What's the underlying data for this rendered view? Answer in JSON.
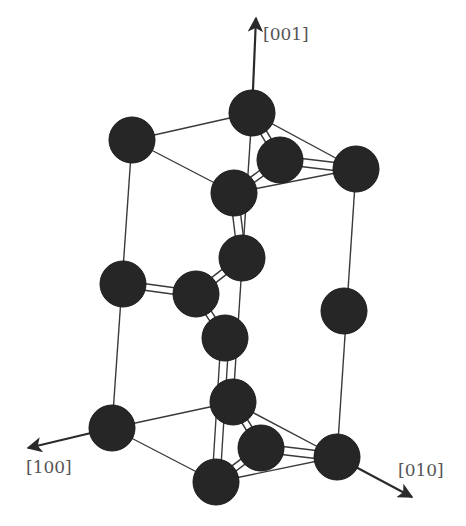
{
  "figure": {
    "title": "",
    "colors": {
      "atom": "#262626",
      "line": "#3a3a3a",
      "label": "#555555",
      "background": "#ffffff"
    },
    "atom_radius": 23
  },
  "axes": [
    {
      "id": "z",
      "label": "[001]",
      "from": [
        252,
        113
      ],
      "to": [
        256,
        18
      ],
      "label_pos": [
        263,
        40
      ]
    },
    {
      "id": "x",
      "label": "[100]",
      "from": [
        112,
        428
      ],
      "to": [
        28,
        448
      ],
      "label_pos": [
        26,
        473
      ]
    },
    {
      "id": "y",
      "label": "[010]",
      "from": [
        337,
        457
      ],
      "to": [
        412,
        497
      ],
      "label_pos": [
        398,
        476
      ]
    }
  ],
  "atoms": [
    {
      "id": "A1",
      "layer": "top",
      "x": 132,
      "y": 140
    },
    {
      "id": "A2",
      "layer": "top",
      "x": 252,
      "y": 113
    },
    {
      "id": "A3",
      "layer": "top",
      "x": 280,
      "y": 160
    },
    {
      "id": "A4",
      "layer": "top",
      "x": 356,
      "y": 169
    },
    {
      "id": "A5",
      "layer": "top",
      "x": 234,
      "y": 193
    },
    {
      "id": "B1",
      "layer": "middle",
      "x": 123,
      "y": 284
    },
    {
      "id": "B2",
      "layer": "middle",
      "x": 196,
      "y": 294
    },
    {
      "id": "B3",
      "layer": "middle",
      "x": 242,
      "y": 258
    },
    {
      "id": "B4",
      "layer": "middle",
      "x": 225,
      "y": 338
    },
    {
      "id": "B5",
      "layer": "middle",
      "x": 344,
      "y": 311
    },
    {
      "id": "C1",
      "layer": "bottom",
      "x": 112,
      "y": 428
    },
    {
      "id": "C2",
      "layer": "bottom",
      "x": 233,
      "y": 402
    },
    {
      "id": "C3",
      "layer": "bottom",
      "x": 261,
      "y": 448
    },
    {
      "id": "C4",
      "layer": "bottom",
      "x": 337,
      "y": 457
    },
    {
      "id": "C5",
      "layer": "bottom",
      "x": 216,
      "y": 482
    }
  ],
  "cell_edges": [
    [
      "A1",
      "A2"
    ],
    [
      "A1",
      "A5"
    ],
    [
      "A2",
      "A4"
    ],
    [
      "A5",
      "A4"
    ],
    [
      "C1",
      "C2"
    ],
    [
      "C1",
      "C5"
    ],
    [
      "C2",
      "C4"
    ],
    [
      "C5",
      "C4"
    ],
    [
      "A1",
      "C1"
    ],
    [
      "A4",
      "C4"
    ],
    [
      "A2",
      "C2"
    ]
  ],
  "double_lines": [
    [
      "A3",
      "A4"
    ],
    [
      "C3",
      "C4"
    ],
    [
      "A5",
      "B3"
    ],
    [
      "B4",
      "C5"
    ]
  ],
  "bonds": [
    [
      "A2",
      "A3"
    ],
    [
      "A3",
      "A5"
    ],
    [
      "B1",
      "B2"
    ],
    [
      "B2",
      "B3"
    ],
    [
      "B2",
      "B4"
    ],
    [
      "C2",
      "C3"
    ],
    [
      "C3",
      "C5"
    ]
  ]
}
